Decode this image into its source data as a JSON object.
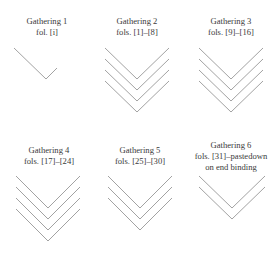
{
  "diagram": {
    "type": "collation-diagram",
    "gatherings": [
      {
        "title": "Gathering 1",
        "folios": "fol. [i]",
        "extra": "",
        "conjugate_pairs": 0,
        "singleton": true,
        "leaves": 1
      },
      {
        "title": "Gathering 2",
        "folios": "fols. [1]–[8]",
        "extra": "",
        "conjugate_pairs": 4,
        "singleton": false,
        "leaves": 8
      },
      {
        "title": "Gathering 3",
        "folios": "fols. [9]–[16]",
        "extra": "",
        "conjugate_pairs": 4,
        "singleton": false,
        "leaves": 8
      },
      {
        "title": "Gathering 4",
        "folios": "fols. [17]–[24]",
        "extra": "",
        "conjugate_pairs": 4,
        "singleton": false,
        "leaves": 8
      },
      {
        "title": "Gathering 5",
        "folios": "fols. [25]–[30]",
        "extra": "",
        "conjugate_pairs": 3,
        "singleton": false,
        "leaves": 6
      },
      {
        "title": "Gathering 6",
        "folios": "fols. [31]–pastedown",
        "extra": "on end binding",
        "conjugate_pairs": 2,
        "singleton": false,
        "leaves": 4
      }
    ]
  },
  "colors": {
    "text": "#3a3a3a",
    "stroke": "#8a8a8a",
    "background": "#ffffff"
  }
}
